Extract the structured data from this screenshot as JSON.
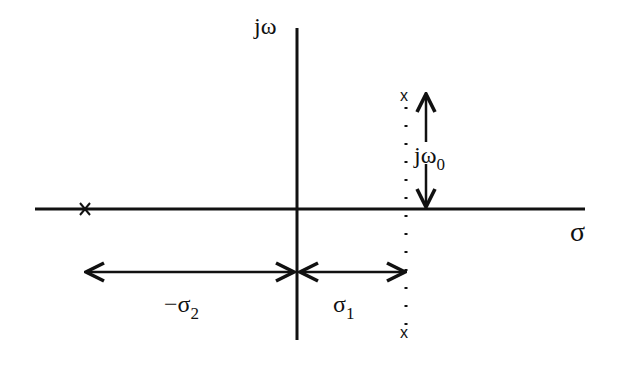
{
  "diagram": {
    "type": "s-plane pole diagram",
    "axes": {
      "vertical_label": "jω",
      "horizontal_label": "σ"
    },
    "poles": [
      {
        "name": "real-pole",
        "marker": "x",
        "position": "on real axis at -σ2"
      },
      {
        "name": "upper-complex-pole",
        "marker": "x",
        "position": "σ1 + jω0"
      },
      {
        "name": "lower-complex-pole",
        "marker": "x",
        "position": "σ1 - jω0"
      }
    ],
    "dimensions": {
      "omega0": {
        "base": "jω",
        "sub": "0"
      },
      "sigma1": {
        "base": "σ",
        "sub": "1"
      },
      "sigma2": {
        "base": "−σ",
        "sub": "2"
      }
    },
    "pole_marker": "x"
  }
}
